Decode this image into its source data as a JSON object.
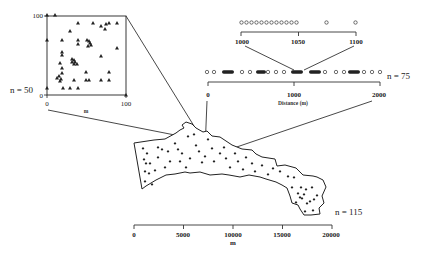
{
  "figure": {
    "inset_square": {
      "n_label": "n = 50",
      "y_ticks": [
        "100",
        "0"
      ],
      "x_ticks": [
        "0",
        "100"
      ],
      "x_unit": "m",
      "marker": "triangle"
    },
    "line_transect_zoom": {
      "ticks": [
        "1000",
        "1050",
        "1100"
      ],
      "marker": "open-circle"
    },
    "line_transect": {
      "n_label": "n = 75",
      "ticks": [
        "0",
        "1000",
        "2000"
      ],
      "axis_label": "Distance (m)",
      "marker": "open-circle"
    },
    "region_map": {
      "n_label": "n = 115",
      "ticks": [
        "0",
        "5000",
        "10000",
        "15000",
        "20000"
      ],
      "axis_label": "m",
      "marker": "diamond"
    }
  }
}
